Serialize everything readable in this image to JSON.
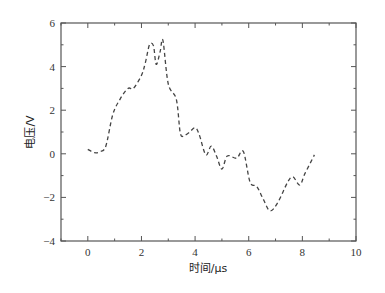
{
  "chart_data": {
    "type": "line",
    "title": "",
    "xlabel": "时间/μs",
    "ylabel": "电压/V",
    "xlim": [
      -1,
      10
    ],
    "ylim": [
      -4,
      6
    ],
    "x_ticks": [
      0,
      2,
      4,
      6,
      8,
      10
    ],
    "x_tick_labels": [
      "0",
      "2",
      "4",
      "6",
      "8",
      "10"
    ],
    "y_ticks": [
      -4,
      -2,
      0,
      2,
      4,
      6
    ],
    "y_tick_labels": [
      "−4",
      "−2",
      "0",
      "2",
      "4",
      "6"
    ],
    "x_minor_step": 1,
    "y_minor_step": 1,
    "grid": false,
    "legend": null,
    "mirrored_ticks": true,
    "series": [
      {
        "name": "voltage",
        "line_style": "dashed",
        "color": "#444444",
        "x": [
          0.0,
          0.25,
          0.45,
          0.67,
          0.93,
          1.2,
          1.5,
          1.7,
          2.0,
          2.15,
          2.3,
          2.45,
          2.55,
          2.7,
          2.8,
          3.0,
          3.3,
          3.45,
          3.6,
          3.8,
          4.0,
          4.15,
          4.4,
          4.6,
          4.8,
          5.0,
          5.2,
          5.55,
          5.8,
          6.05,
          6.3,
          6.55,
          6.8,
          7.1,
          7.45,
          7.65,
          7.9,
          8.1,
          8.45
        ],
        "y": [
          0.2,
          0.05,
          0.1,
          0.35,
          1.8,
          2.5,
          3.0,
          3.0,
          3.6,
          4.2,
          5.0,
          4.95,
          4.1,
          4.7,
          5.2,
          3.2,
          2.5,
          0.95,
          0.85,
          1.0,
          1.2,
          0.9,
          -0.05,
          0.35,
          -0.1,
          -0.7,
          -0.1,
          -0.2,
          0.1,
          -1.3,
          -1.5,
          -2.1,
          -2.62,
          -2.2,
          -1.3,
          -1.06,
          -1.43,
          -0.9,
          -0.05
        ]
      }
    ]
  }
}
